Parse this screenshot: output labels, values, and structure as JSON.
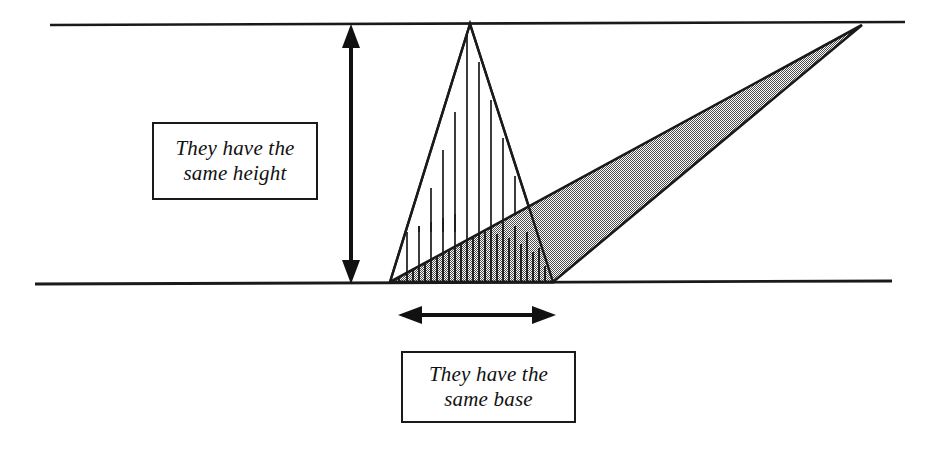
{
  "page": {
    "background": "#ffffff",
    "width": 930,
    "height": 455
  },
  "callouts": {
    "height": {
      "name": "they-have-the-same-height",
      "line1": "They have the",
      "line2": "same height",
      "border_color": "#1a1a1a",
      "text_color": "#111111"
    },
    "base": {
      "name": "they-have-the-same-base",
      "line1": "They have the",
      "line2": "same base",
      "border_color": "#1a1a1a",
      "text_color": "#111111"
    }
  },
  "colors": {
    "stroke": "#1a1a1a",
    "gray_fill": "#999999",
    "hatch": "#1a1a1a",
    "white": "#ffffff"
  },
  "geometry": {
    "top_line": {
      "x1": 50,
      "y1": 25,
      "x2": 905,
      "y2": 22
    },
    "bottom_line": {
      "x1": 35,
      "y1": 284,
      "x2": 892,
      "y2": 281
    },
    "base_left": {
      "x": 390,
      "y": 282
    },
    "base_right": {
      "x": 553,
      "y": 282
    },
    "tall_triangle_apex": {
      "x": 470,
      "y": 24
    },
    "gray_triangle_apex": {
      "x": 862,
      "y": 25
    },
    "height_arrow": {
      "x": 351,
      "y_top": 27,
      "y_bottom": 281
    },
    "base_arrow": {
      "y": 315,
      "x_left": 400,
      "x_right": 553
    }
  },
  "labels": {
    "tall_triangle": "hatched-triangle",
    "slanted_triangle": "shaded-triangle",
    "height_measure": "height-double-arrow",
    "base_measure": "base-double-arrow"
  }
}
